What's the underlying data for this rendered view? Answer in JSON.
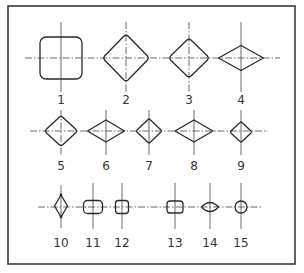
{
  "diagram": {
    "title": "",
    "colors": {
      "background": "#ffffff",
      "stroke": "#2a2a2a",
      "frame": "#3a3a3a",
      "text": "#333333"
    },
    "rows": [
      {
        "axis_y": 58,
        "axis_x_start": 25,
        "axis_x_end": 280,
        "label_y": 104,
        "items": [
          {
            "id": "1",
            "label": "1",
            "shape": "rounded-square",
            "cx": 61,
            "cy": 58,
            "w": 42,
            "h": 42,
            "r": 6,
            "v_top": 22,
            "v_bottom": 92
          },
          {
            "id": "2",
            "label": "2",
            "shape": "rounded-diamond",
            "cx": 126,
            "cy": 58,
            "w": 46,
            "h": 47,
            "v_top": 22,
            "v_bottom": 92
          },
          {
            "id": "3",
            "label": "3",
            "shape": "rounded-diamond",
            "cx": 189,
            "cy": 58,
            "w": 39,
            "h": 39,
            "v_top": 22,
            "v_bottom": 92
          },
          {
            "id": "4",
            "label": "4",
            "shape": "rhombus",
            "cx": 241,
            "cy": 58,
            "w": 45,
            "h": 25,
            "v_top": 22,
            "v_bottom": 92
          }
        ]
      },
      {
        "axis_y": 131,
        "axis_x_start": 30,
        "axis_x_end": 268,
        "label_y": 170,
        "items": [
          {
            "id": "5",
            "label": "5",
            "shape": "rounded-diamond",
            "cx": 61,
            "cy": 131,
            "w": 32,
            "h": 30,
            "v_top": 110,
            "v_bottom": 155
          },
          {
            "id": "6",
            "label": "6",
            "shape": "rhombus",
            "cx": 106,
            "cy": 131,
            "w": 37,
            "h": 22,
            "v_top": 110,
            "v_bottom": 155
          },
          {
            "id": "7",
            "label": "7",
            "shape": "rounded-diamond",
            "cx": 149,
            "cy": 131,
            "w": 26,
            "h": 25,
            "v_top": 110,
            "v_bottom": 155
          },
          {
            "id": "8",
            "label": "8",
            "shape": "rhombus",
            "cx": 194,
            "cy": 131,
            "w": 38,
            "h": 22,
            "v_top": 110,
            "v_bottom": 155
          },
          {
            "id": "9",
            "label": "9",
            "shape": "rounded-diamond",
            "cx": 241,
            "cy": 132,
            "w": 22,
            "h": 20,
            "v_top": 110,
            "v_bottom": 155
          }
        ]
      },
      {
        "axis_y": 207,
        "axis_x_start": 38,
        "axis_x_end": 262,
        "label_y": 247,
        "items": [
          {
            "id": "10",
            "label": "10",
            "shape": "vertical-rhombus-dotted",
            "cx": 61,
            "cy": 206,
            "w": 13,
            "h": 22,
            "v_top": 185,
            "v_bottom": 228
          },
          {
            "id": "11",
            "label": "11",
            "shape": "rounded-rect",
            "cx": 93,
            "cy": 207,
            "w": 19,
            "h": 13,
            "r": 4,
            "v_top": 183,
            "v_bottom": 229
          },
          {
            "id": "12",
            "label": "12",
            "shape": "rounded-rect",
            "cx": 122,
            "cy": 207,
            "w": 13,
            "h": 13,
            "r": 3,
            "v_top": 183,
            "v_bottom": 229
          },
          {
            "id": "13",
            "label": "13",
            "shape": "rounded-rect",
            "cx": 175,
            "cy": 207,
            "w": 16,
            "h": 12,
            "r": 3,
            "v_top": 183,
            "v_bottom": 229
          },
          {
            "id": "14",
            "label": "14",
            "shape": "lens",
            "cx": 210,
            "cy": 207,
            "w": 17,
            "h": 10,
            "v_top": 183,
            "v_bottom": 229
          },
          {
            "id": "15",
            "label": "15",
            "shape": "circle",
            "cx": 241,
            "cy": 207,
            "r": 6,
            "v_top": 183,
            "v_bottom": 229
          }
        ]
      }
    ],
    "labels": {
      "row1": [
        "1",
        "2",
        "3",
        "4"
      ],
      "row2": [
        "5",
        "6",
        "7",
        "8",
        "9"
      ],
      "row3": [
        "10",
        "11",
        "12",
        "13",
        "14",
        "15"
      ]
    }
  }
}
